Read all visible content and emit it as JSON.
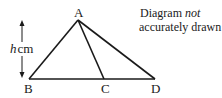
{
  "diagram": {
    "note_line1_a": "Diagram ",
    "note_line1_b": "not",
    "note_line2": "accurately drawn",
    "points": {
      "A": {
        "label": "A",
        "x": 78,
        "y": 20
      },
      "B": {
        "label": "B",
        "x": 29,
        "y": 79
      },
      "C": {
        "label": "C",
        "x": 104,
        "y": 79
      },
      "D": {
        "label": "D",
        "x": 155,
        "y": 79
      }
    },
    "height_label_var": "h",
    "height_label_unit": "cm",
    "line_color": "#1a1a1a"
  }
}
